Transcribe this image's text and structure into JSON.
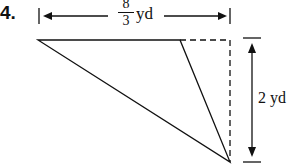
{
  "problem": {
    "number": "4.",
    "width_label": {
      "numerator": "8",
      "denominator": "3",
      "unit": "yd"
    },
    "height_label": "2 yd"
  },
  "figure": {
    "type": "triangle",
    "vertices": [
      [
        38,
        40
      ],
      [
        180,
        40
      ],
      [
        230,
        162
      ]
    ],
    "dashed_guide": [
      [
        180,
        40
      ],
      [
        230,
        40
      ],
      [
        230,
        162
      ]
    ]
  }
}
